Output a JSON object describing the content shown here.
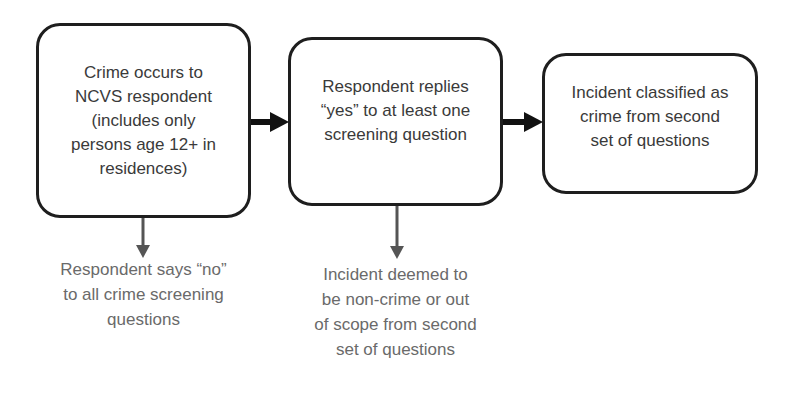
{
  "diagram": {
    "type": "flowchart",
    "nodes": [
      {
        "id": "crime-occurs",
        "text": "Crime occurs to\nNCVS respondent\n(includes only\npersons age 12+ in\nresidences)"
      },
      {
        "id": "replies-yes",
        "text": "Respondent replies\n“yes” to at least one\nscreening question"
      },
      {
        "id": "classified-crime",
        "text": "Incident classified as\ncrime from second\nset of questions"
      }
    ],
    "exits": [
      {
        "from": "crime-occurs",
        "text": "Respondent says “no”\nto all crime screening\nquestions"
      },
      {
        "from": "replies-yes",
        "text": "Incident deemed to\nbe non-crime or out\nof scope from second\nset of questions"
      }
    ],
    "edges": [
      {
        "from": "crime-occurs",
        "to": "replies-yes",
        "style": "thick-black-arrow"
      },
      {
        "from": "replies-yes",
        "to": "classified-crime",
        "style": "thick-black-arrow"
      },
      {
        "from": "crime-occurs",
        "to": "exit-0",
        "style": "gray-down-arrow"
      },
      {
        "from": "replies-yes",
        "to": "exit-1",
        "style": "gray-down-arrow"
      }
    ],
    "colors": {
      "box_border": "#1e1e1e",
      "box_text": "#3a3a3a",
      "exit_text": "#6a6a6a",
      "main_arrow": "#111111",
      "exit_arrow": "#555555"
    }
  }
}
